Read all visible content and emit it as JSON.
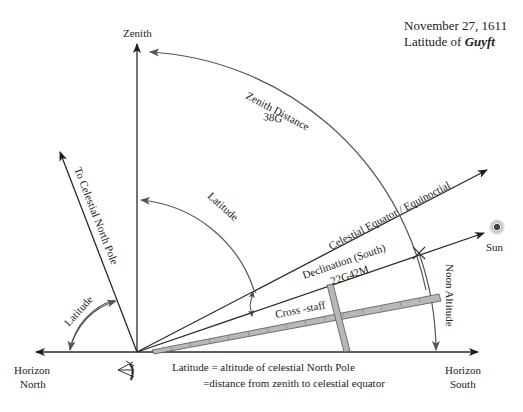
{
  "header": {
    "date": "November 27, 1611",
    "latitude_prefix": "Latitude of ",
    "place": "Guyft"
  },
  "labels": {
    "zenith": "Zenith",
    "zenith_distance": "Zenith Distance",
    "zenith_distance_value": "38G",
    "celestial_north_pole": "To Celestial North Pole",
    "latitude_upper": "Latitude",
    "latitude_lower": "Latitude",
    "celestial_equator": "Celestial Equator / Equinoctial",
    "declination": "Declination (South)",
    "declination_value": "22G42M",
    "sun": "Sun",
    "noon_altitude": "Noon Altitude",
    "cross_staff": "Cross -staff",
    "horizon_north_1": "Horizon",
    "horizon_north_2": "North",
    "horizon_south_1": "Horizon",
    "horizon_south_2": "South",
    "caption_line1": "Latitude = altitude of celestial North Pole",
    "caption_line2": "=distance from zenith to celestial equator"
  },
  "colors": {
    "line": "#2a2a2a",
    "arc": "#555555",
    "staff_fill": "#b8b8b8",
    "sun_glow": "#cfcfcf"
  }
}
